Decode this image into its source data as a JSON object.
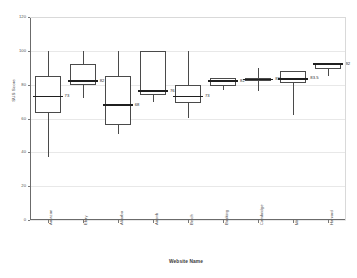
{
  "chart_data": {
    "type": "box",
    "title": "",
    "xlabel": "Website Name",
    "ylabel": "SUS Score",
    "ylim": [
      0,
      120
    ],
    "yticks": [
      0,
      20,
      40,
      60,
      80,
      100,
      120
    ],
    "grid": true,
    "legend": "none",
    "categories": [
      "Amazon",
      "Ebay",
      "Alibaba",
      "Airbnb",
      "Betch",
      "Booking",
      "Cambridge",
      "Mit",
      "Harvard"
    ],
    "boxes": [
      {
        "label": "Amazon",
        "whisker_low": 37,
        "q1": 63,
        "median": 73,
        "q3": 85,
        "whisker_high": 100,
        "median_label": "73"
      },
      {
        "label": "Ebay",
        "whisker_low": 72,
        "q1": 80,
        "median": 82,
        "q3": 92,
        "whisker_high": 100,
        "median_label": "82"
      },
      {
        "label": "Alibaba",
        "whisker_low": 51,
        "q1": 56,
        "median": 68,
        "q3": 85,
        "whisker_high": 100,
        "median_label": "68"
      },
      {
        "label": "Airbnb",
        "whisker_low": 70,
        "q1": 74,
        "median": 76,
        "q3": 100,
        "whisker_high": 100,
        "median_label": "76"
      },
      {
        "label": "Betch",
        "whisker_low": 60,
        "q1": 69,
        "median": 73,
        "q3": 80,
        "whisker_high": 100,
        "median_label": "73"
      },
      {
        "label": "Booking",
        "whisker_low": 77,
        "q1": 79,
        "median": 82,
        "q3": 84,
        "whisker_high": 84,
        "median_label": "82"
      },
      {
        "label": "Cambridge",
        "whisker_low": 76,
        "q1": 82,
        "median": 83,
        "q3": 84,
        "whisker_high": 90,
        "median_label": "83"
      },
      {
        "label": "Mit",
        "whisker_low": 62,
        "q1": 81,
        "median": 83.5,
        "q3": 88,
        "whisker_high": 88,
        "median_label": "83.5"
      },
      {
        "label": "Harvard",
        "whisker_low": 85,
        "q1": 89,
        "median": 92,
        "q3": 93,
        "whisker_high": 93,
        "median_label": "92"
      }
    ]
  },
  "colors": {
    "box_stroke": "#4a4a4a",
    "median_stroke": "#1f1f1f",
    "grid": "#e8e8e8",
    "axis": "#6b6b6b",
    "background": "#ffffff"
  }
}
